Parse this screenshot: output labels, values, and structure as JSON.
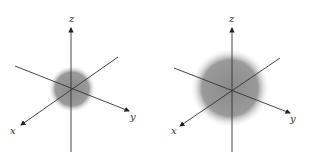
{
  "figure": {
    "panels": [
      {
        "name": "small-sphere",
        "labels": {
          "x": "x",
          "y": "y",
          "z": "z"
        },
        "sphere_color": "#7a7a7a"
      },
      {
        "name": "large-sphere",
        "labels": {
          "x": "x",
          "y": "y",
          "z": "z"
        },
        "sphere_color": "#7a7a7a"
      }
    ]
  }
}
